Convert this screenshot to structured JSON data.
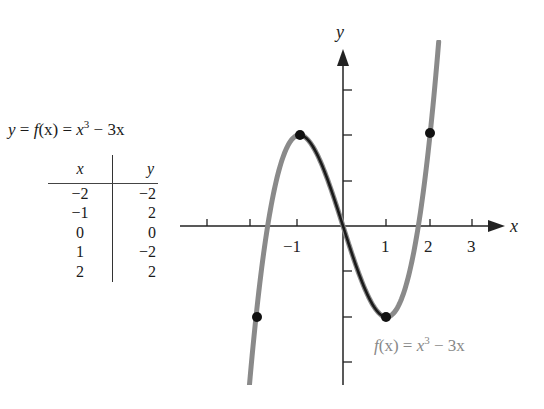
{
  "chart_data": {
    "type": "line",
    "function": "x^3 - 3x",
    "xlabel": "x",
    "ylabel": "y",
    "x_tick_labels": [
      "-1",
      "1",
      "2",
      "3"
    ],
    "x_ticks": [
      -3,
      -2,
      -1,
      1,
      2,
      3
    ],
    "y_ticks": [
      -3,
      -2,
      -1,
      1,
      2,
      3
    ],
    "xlim": [
      -3.8,
      3.8
    ],
    "ylim": [
      -3.5,
      4.0
    ],
    "grid": false,
    "table": {
      "columns": [
        "x",
        "y"
      ],
      "rows": [
        [
          -2,
          -2
        ],
        [
          -1,
          2
        ],
        [
          0,
          0
        ],
        [
          1,
          -2
        ],
        [
          2,
          2
        ]
      ]
    },
    "points": [
      {
        "x": -2,
        "y": -2
      },
      {
        "x": -1,
        "y": 2
      },
      {
        "x": 1,
        "y": -2
      },
      {
        "x": 2,
        "y": 2
      }
    ],
    "series": [
      {
        "name": "f(x) = x^3 - 3x",
        "color": "#8a8a8a",
        "x_range": [
          -2.2,
          2.2
        ]
      },
      {
        "name": "highlighted segment",
        "color": "#1a1a1a",
        "x_range": [
          -1,
          1
        ]
      }
    ],
    "annotations": [
      "f(x) = x^3 - 3x"
    ]
  },
  "header": {
    "lhs": "y",
    "eq1": " = ",
    "fn": "f",
    "arg": "(x)",
    "eq2": " = ",
    "base": "x",
    "exp": "3",
    "rest": " − 3x"
  },
  "table": {
    "col_x": "x",
    "col_y": "y",
    "rows": [
      {
        "x": "−2",
        "y": "−2"
      },
      {
        "x": "−1",
        "y": "2"
      },
      {
        "x": "0",
        "y": "0"
      },
      {
        "x": "1",
        "y": "−2"
      },
      {
        "x": "2",
        "y": "2"
      }
    ]
  },
  "axes": {
    "x_label": "x",
    "y_label": "y",
    "ticks": {
      "m1": "−1",
      "p1": "1",
      "p2": "2",
      "p3": "3"
    }
  },
  "curve_label": {
    "fn": "f",
    "arg": "(x) = ",
    "base": "x",
    "exp": "3",
    "rest": " − 3x"
  },
  "colors": {
    "curve": "#8a8a8a",
    "segment": "#1a1a1a",
    "axis": "#222222"
  }
}
